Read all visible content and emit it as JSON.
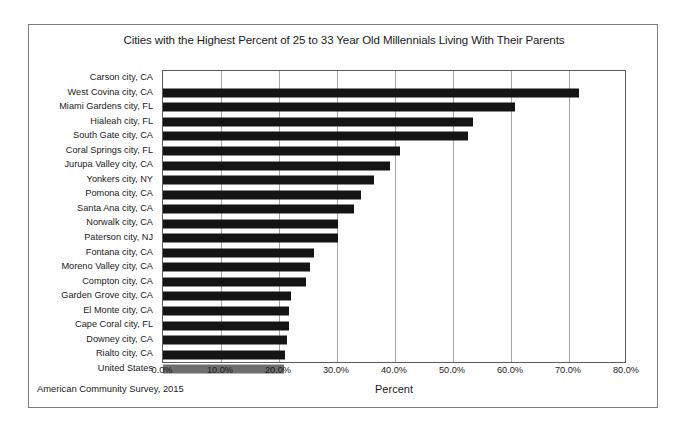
{
  "chart_data": {
    "type": "bar",
    "orientation": "horizontal",
    "title": "Cities with the Highest Percent of 25 to 33 Year Old Millennials Living With Their Parents",
    "xlabel": "Percent",
    "ylabel": "",
    "xlim": [
      0,
      80
    ],
    "xtick_labels": [
      "0.0%",
      "10.0%",
      "20.0%",
      "30.0%",
      "40.0%",
      "50.0%",
      "60.0%",
      "70.0%",
      "80.0%"
    ],
    "xtick_values": [
      0,
      10,
      20,
      30,
      40,
      50,
      60,
      70,
      80
    ],
    "grid": true,
    "legend": null,
    "source_note": "American Community Survey, 2015",
    "bar_color": "#141414",
    "highlight_color": "#6e6e6e",
    "categories": [
      "Carson city, CA",
      "West Covina city, CA",
      "Miami Gardens city, FL",
      "Hialeah city, FL",
      "South Gate city, CA",
      "Coral Springs city, FL",
      "Jurupa Valley city, CA",
      "Yonkers city, NY",
      "Pomona city, CA",
      "Santa Ana city, CA",
      "Norwalk city, CA",
      "Paterson city, NJ",
      "Fontana city, CA",
      "Moreno Valley city, CA",
      "Compton city, CA",
      "Garden Grove city, CA",
      "El Monte city, CA",
      "Cape Coral city, FL",
      "Downey city, CA",
      "Rialto city, CA",
      "United States"
    ],
    "values": [
      0,
      71.8,
      60.7,
      53.5,
      52.6,
      40.8,
      39.1,
      36.4,
      34.2,
      33.0,
      30.2,
      30.1,
      26.1,
      25.4,
      24.6,
      22.1,
      21.8,
      21.7,
      21.4,
      21.1,
      20.9
    ],
    "highlight_index": 20
  }
}
